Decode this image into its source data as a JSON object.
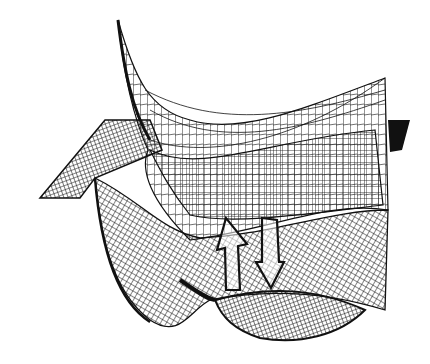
{
  "figure": {
    "type": "3d-wireframe-surface",
    "arrows": [
      "up-arrow",
      "down-arrow"
    ],
    "colors": {
      "ink": "#111111",
      "background": "#ffffff"
    }
  },
  "caption": {
    "text": ""
  }
}
